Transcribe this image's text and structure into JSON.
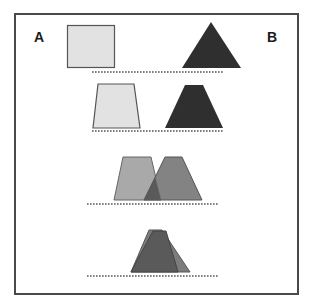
{
  "labels": {
    "left": "A",
    "right": "B"
  },
  "colors": {
    "frame_border": "#4a4a4a",
    "shape_a_fill": "#e2e2e2",
    "shape_a_stroke": "#555555",
    "shape_b_fill": "#2f2f2f",
    "shape_a_mid_fill": "#a9a9a9",
    "shape_b_mid_fill": "#7c7c7c",
    "overlap_fill": "#5a5a5a",
    "dotted_line": "#555555"
  },
  "rows": [
    {
      "description": "Square A and triangle B separated"
    },
    {
      "description": "A becomes trapezoid, B becomes trapezoid, moving closer"
    },
    {
      "description": "Trapezoids A and B overlap partially"
    },
    {
      "description": "Trapezoids A and B nearly fully overlap"
    }
  ]
}
